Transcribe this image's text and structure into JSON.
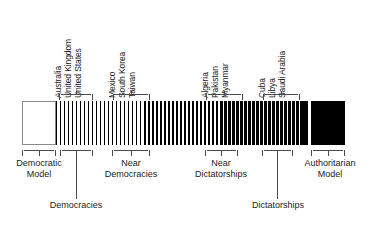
{
  "figure": {
    "orientation": "horizontal-gradient-bar"
  },
  "chart_data": {
    "type": "bar",
    "xlabel": "",
    "ylabel": "",
    "categories": [
      "Democratic Model",
      "Democracies",
      "Near Democracies",
      "Near Dictatorships",
      "Dictatorships",
      "Authoritarian Model"
    ],
    "values": [
      0,
      1,
      2,
      3,
      4,
      5
    ],
    "annotations": [
      "Australia",
      "United Kingdom",
      "United States",
      "Mexico",
      "South Korea",
      "Taiwan",
      "Algeria",
      "Pakistan",
      "Myanmar",
      "Cuba",
      "Libya",
      "Saudi Arabia"
    ],
    "legend": [],
    "grid": false
  },
  "bar": {
    "left_end_label": "Democratic Model",
    "right_end_label": "Authoritarian Model",
    "left_color": "#ffffff",
    "right_color": "#000000",
    "stroke_color": "#8a8a8a"
  },
  "country_groups": [
    {
      "id": "democracies",
      "countries": [
        "Australia",
        "United Kingdom",
        "United States"
      ]
    },
    {
      "id": "near-democracies",
      "countries": [
        "Mexico",
        "South Korea",
        "Taiwan"
      ]
    },
    {
      "id": "near-dictatorships",
      "countries": [
        "Algeria",
        "Pakistan",
        "Myanmar"
      ]
    },
    {
      "id": "dictatorships",
      "countries": [
        "Cuba",
        "Libya",
        "Saudi Arabia"
      ]
    }
  ],
  "categories": {
    "democratic_model_line1": "Democratic",
    "democratic_model_line2": "Model",
    "near_democracies_line1": "Near",
    "near_democracies_line2": "Democracies",
    "near_dictatorships_line1": "Near",
    "near_dictatorships_line2": "Dictatorships",
    "authoritarian_model_line1": "Authoritarian",
    "authoritarian_model_line2": "Model",
    "democracies": "Democracies",
    "dictatorships": "Dictatorships"
  }
}
